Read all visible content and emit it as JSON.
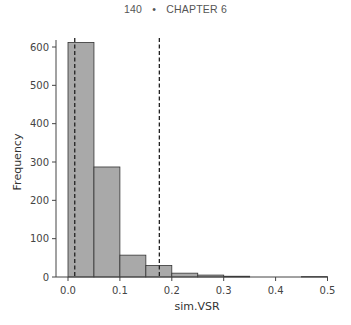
{
  "header": {
    "page_number": "140",
    "separator": "•",
    "chapter": "CHAPTER 6"
  },
  "chart_data": {
    "type": "bar",
    "subtype": "histogram",
    "title": "",
    "xlabel": "sim.VSR",
    "ylabel": "Frequency",
    "xlim": [
      0.0,
      0.5
    ],
    "ylim": [
      0,
      630
    ],
    "x_ticks": [
      "0.0",
      "0.1",
      "0.2",
      "0.3",
      "0.4",
      "0.5"
    ],
    "y_ticks": [
      "0",
      "100",
      "200",
      "300",
      "400",
      "500",
      "600"
    ],
    "bin_width": 0.05,
    "bins": [
      {
        "start": 0.0,
        "end": 0.05,
        "count": 612
      },
      {
        "start": 0.05,
        "end": 0.1,
        "count": 287
      },
      {
        "start": 0.1,
        "end": 0.15,
        "count": 57
      },
      {
        "start": 0.15,
        "end": 0.2,
        "count": 30
      },
      {
        "start": 0.2,
        "end": 0.25,
        "count": 10
      },
      {
        "start": 0.25,
        "end": 0.3,
        "count": 5
      },
      {
        "start": 0.3,
        "end": 0.35,
        "count": 2
      },
      {
        "start": 0.35,
        "end": 0.4,
        "count": 0
      },
      {
        "start": 0.4,
        "end": 0.45,
        "count": 0
      },
      {
        "start": 0.45,
        "end": 0.5,
        "count": 1
      }
    ],
    "categories": [
      "0.00-0.05",
      "0.05-0.10",
      "0.10-0.15",
      "0.15-0.20",
      "0.20-0.25",
      "0.25-0.30",
      "0.30-0.35",
      "0.35-0.40",
      "0.40-0.45",
      "0.45-0.50"
    ],
    "values": [
      612,
      287,
      57,
      30,
      10,
      5,
      2,
      0,
      0,
      1
    ],
    "reference_lines": [
      {
        "orientation": "vertical",
        "x": 0.013,
        "style": "dashed"
      },
      {
        "orientation": "vertical",
        "x": 0.176,
        "style": "dashed"
      }
    ],
    "grid": false,
    "legend": null,
    "colors": {
      "bar_fill": "#a9a9a9",
      "bar_edge": "#333333",
      "axis": "#444444",
      "reference_line": "#222222"
    }
  }
}
